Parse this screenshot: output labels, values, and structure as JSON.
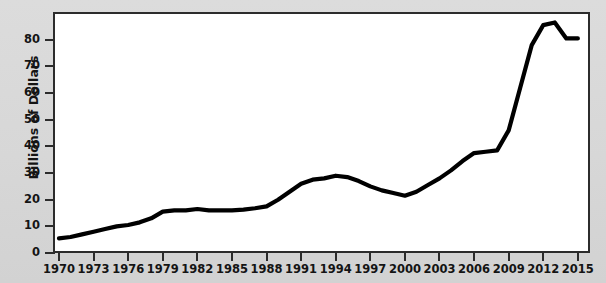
{
  "chart_data": {
    "type": "line",
    "title": "",
    "xlabel": "",
    "ylabel": "Billions of Dollars",
    "xlim": [
      1970,
      2015
    ],
    "ylim": [
      0,
      88
    ],
    "ytick_labels": [
      "0",
      "10",
      "20",
      "30",
      "40",
      "50",
      "60",
      "70",
      "80"
    ],
    "ytick_values": [
      0,
      10,
      20,
      30,
      40,
      50,
      60,
      70,
      80
    ],
    "xtick_labels": [
      "1970",
      "1973",
      "1976",
      "1979",
      "1982",
      "1985",
      "1988",
      "1991",
      "1994",
      "1997",
      "2000",
      "2003",
      "2006",
      "2009",
      "2012",
      "2015"
    ],
    "xtick_values": [
      1970,
      1973,
      1976,
      1979,
      1982,
      1985,
      1988,
      1991,
      1994,
      1997,
      2000,
      2003,
      2006,
      2009,
      2012,
      2015
    ],
    "grid": false,
    "legend": "none",
    "line_color": "#000000",
    "line_width": 4,
    "x": [
      1970,
      1971,
      1972,
      1973,
      1974,
      1975,
      1976,
      1977,
      1978,
      1979,
      1980,
      1981,
      1982,
      1983,
      1984,
      1985,
      1986,
      1987,
      1988,
      1989,
      1990,
      1991,
      1992,
      1993,
      1994,
      1995,
      1996,
      1997,
      1998,
      1999,
      2000,
      2001,
      2002,
      2003,
      2004,
      2005,
      2006,
      2007,
      2008,
      2009,
      2010,
      2011,
      2012,
      2013,
      2014,
      2015
    ],
    "values": [
      5.5,
      6.0,
      7.0,
      8.0,
      9.0,
      10.0,
      10.5,
      11.5,
      13.0,
      15.5,
      16.0,
      16.0,
      16.5,
      16.0,
      16.0,
      16.0,
      16.3,
      16.8,
      17.5,
      20.0,
      23.0,
      26.0,
      27.5,
      28.0,
      29.0,
      28.5,
      27.0,
      25.0,
      23.5,
      22.5,
      21.5,
      23.0,
      25.5,
      28.0,
      31.0,
      34.5,
      37.5,
      38.0,
      38.5,
      46.0,
      62.0,
      78.0,
      85.5,
      86.5,
      80.5,
      80.5
    ],
    "annotations": []
  },
  "axis": {
    "y_title": "Billions of Dollars"
  }
}
